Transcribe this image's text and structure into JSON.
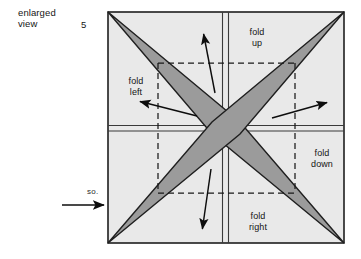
{
  "figure": {
    "caption": "enlarged\nview",
    "caption_line1": "enlarged",
    "caption_line2": "view",
    "step_number": "5",
    "so_label": "so.",
    "fold_labels": {
      "up": "fold\nup",
      "up_line1": "fold",
      "up_line2": "up",
      "left": "fold\nleft",
      "left_line1": "fold",
      "left_line2": "left",
      "down": "fold\ndown",
      "down_line1": "fold",
      "down_line2": "down",
      "right": "fold\nright",
      "right_line1": "fold",
      "right_line2": "right"
    },
    "colors": {
      "paper_fill": "#e9e9e9",
      "star_fill": "#9b9b9b",
      "outline": "#1f1f1f",
      "crease": "#3a3a3a",
      "dashed": "#1a1a1a",
      "arrow": "#0d0d0d",
      "background": "#ffffff"
    },
    "geometry": {
      "square_left": 108,
      "square_top": 12,
      "square_right": 344,
      "square_bottom": 243,
      "center_x": 226,
      "center_y": 128,
      "dashed_vertical_left_x": 158,
      "dashed_vertical_right_x": 295,
      "dashed_horizontal_top_y": 63,
      "dashed_horizontal_bottom_y": 193
    },
    "arrows": {
      "up": {
        "x1": 215,
        "y1": 93,
        "x2": 203,
        "y2": 32
      },
      "left": {
        "x1": 197,
        "y1": 116,
        "x2": 138,
        "y2": 101
      },
      "right": {
        "x1": 272,
        "y1": 118,
        "x2": 329,
        "y2": 102
      },
      "down": {
        "x1": 211,
        "y1": 169,
        "x2": 202,
        "y2": 231
      },
      "entry": {
        "x1": 62,
        "y1": 205,
        "x2": 106,
        "y2": 205
      }
    }
  }
}
